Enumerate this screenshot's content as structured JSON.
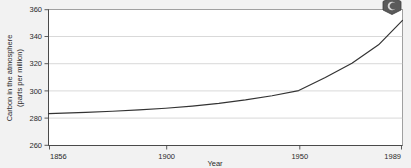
{
  "figure": {
    "background_color": "#f2f2f2",
    "plot_background_color": "#ffffff"
  },
  "corner_icon": {
    "name": "hexagon-badge-icon",
    "color": "#555555"
  },
  "chart_data": {
    "type": "line",
    "title": "",
    "subtitle": "",
    "xlabel": "Year",
    "ylabel": "Carbon in the atmosphere\n(parts per million)",
    "ylabel_line1": "Carbon in the atmosphere",
    "ylabel_line2": "(parts per million)",
    "xlim": [
      1856,
      1989
    ],
    "ylim": [
      260,
      360
    ],
    "xticks": [
      1856,
      1900,
      1950,
      1989
    ],
    "xtick_labels": [
      "1856",
      "1900",
      "1950",
      "1989"
    ],
    "yticks": [
      260,
      280,
      300,
      320,
      340,
      360
    ],
    "ytick_labels": [
      "260",
      "280",
      "300",
      "320",
      "340",
      "360"
    ],
    "grid": "horizontal",
    "legend": "none",
    "line_color": "#333333",
    "line_width": 1.2,
    "x": [
      1856,
      1870,
      1880,
      1890,
      1900,
      1910,
      1920,
      1930,
      1940,
      1950,
      1960,
      1970,
      1980,
      1989
    ],
    "values": [
      283.4,
      284.4,
      285.2,
      286.2,
      287.4,
      289.0,
      291.0,
      293.5,
      296.6,
      300.4,
      310.0,
      320.5,
      334.0,
      352.0
    ],
    "series": [
      {
        "name": "Atmospheric CO2",
        "values": [
          283.4,
          284.4,
          285.2,
          286.2,
          287.4,
          289.0,
          291.0,
          293.5,
          296.6,
          300.4,
          310.0,
          320.5,
          334.0,
          352.0
        ]
      }
    ]
  }
}
